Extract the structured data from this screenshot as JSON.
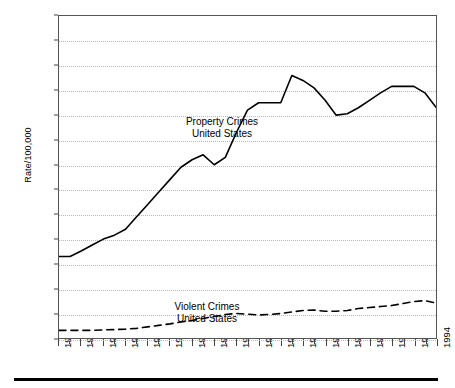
{
  "chart_data": {
    "type": "line",
    "title": "",
    "xlabel": "",
    "ylabel": "Rate/100,000",
    "xlim": [
      1960,
      1994
    ],
    "ylim": [
      0,
      6500
    ],
    "ytick_step": 500,
    "xtick_step": 2,
    "grid": true,
    "legend_position": "inside-annotations",
    "yticks": [
      0,
      500,
      1000,
      1500,
      2000,
      2500,
      3000,
      3500,
      4000,
      4500,
      5000,
      5500,
      6000,
      6500
    ],
    "xticks": [
      1960,
      1962,
      1964,
      1966,
      1968,
      1970,
      1972,
      1974,
      1976,
      1978,
      1980,
      1982,
      1984,
      1986,
      1988,
      1990,
      1992,
      1994
    ],
    "x": [
      1960,
      1961,
      1962,
      1963,
      1964,
      1965,
      1966,
      1967,
      1968,
      1969,
      1970,
      1971,
      1972,
      1973,
      1974,
      1975,
      1976,
      1977,
      1978,
      1979,
      1980,
      1981,
      1982,
      1983,
      1984,
      1985,
      1986,
      1987,
      1988,
      1989,
      1990,
      1991,
      1992,
      1993,
      1994
    ],
    "series": [
      {
        "name": "Property Crimes United States",
        "style": "solid",
        "color": "#000000",
        "values": [
          1650,
          1650,
          1760,
          1880,
          2000,
          2080,
          2200,
          2450,
          2700,
          2950,
          3200,
          3450,
          3600,
          3700,
          3500,
          3650,
          4150,
          4600,
          4750,
          4750,
          4750,
          5300,
          5200,
          5050,
          4800,
          4500,
          4530,
          4650,
          4800,
          4950,
          5080,
          5080,
          5080,
          4950,
          4660
        ]
      },
      {
        "name": "Violent Crimes United States",
        "style": "dashed",
        "color": "#000000",
        "values": [
          160,
          160,
          160,
          160,
          170,
          175,
          185,
          200,
          230,
          260,
          290,
          330,
          360,
          400,
          440,
          480,
          500,
          485,
          470,
          480,
          500,
          530,
          560,
          570,
          545,
          545,
          560,
          600,
          620,
          640,
          660,
          700,
          740,
          760,
          710
        ]
      }
    ],
    "annotations": [
      {
        "id": "property",
        "text": "Property Crimes\nUnited States"
      },
      {
        "id": "violent",
        "text": "Violent Crimes\nUnited States"
      }
    ]
  }
}
